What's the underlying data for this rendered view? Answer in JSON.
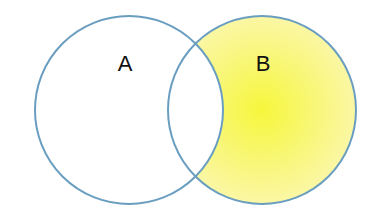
{
  "diagram": {
    "type": "venn",
    "sets": [
      {
        "id": "A",
        "label": "A",
        "cx": 129,
        "cy": 110,
        "r": 94,
        "label_x": 125,
        "label_y": 71
      },
      {
        "id": "B",
        "label": "B",
        "cx": 262,
        "cy": 110,
        "r": 94,
        "label_x": 263,
        "label_y": 71
      }
    ],
    "highlighted_region": "B minus A",
    "colors": {
      "stroke": "#6a9ec0",
      "fill_center": "#f6f63c",
      "fill_edge": "#fbf7b0",
      "background": "#ffffff",
      "label": "#111111"
    }
  }
}
